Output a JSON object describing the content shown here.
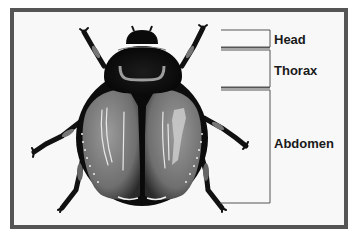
{
  "diagram": {
    "labels": [
      {
        "id": "head",
        "text": "Head"
      },
      {
        "id": "thorax",
        "text": "Thorax"
      },
      {
        "id": "abdomen",
        "text": "Abdomen"
      }
    ],
    "colors": {
      "frame_border": "#555555",
      "frame_fill": "#f8f8f8",
      "bracket_line": "#555555",
      "beetle_dark": "#111111",
      "elytra_gray": "#7a7a7a",
      "label_text": "#1a1a1a"
    }
  }
}
